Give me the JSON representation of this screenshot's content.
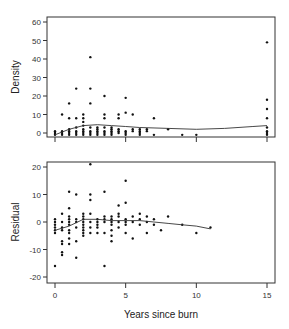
{
  "chart_data": [
    {
      "type": "scatter",
      "panel": "top",
      "title": "",
      "xlabel": "",
      "ylabel": "Density",
      "xlim": [
        -0.5,
        15.5
      ],
      "ylim": [
        -2,
        62
      ],
      "yticks": [
        0,
        10,
        20,
        30,
        40,
        50,
        60
      ],
      "xticks": [
        0,
        5,
        10,
        15
      ],
      "grid": false,
      "points": [
        [
          0,
          0
        ],
        [
          0,
          1
        ],
        [
          0,
          -1
        ],
        [
          0.5,
          0
        ],
        [
          0.5,
          1
        ],
        [
          0.5,
          -1
        ],
        [
          0.5,
          10
        ],
        [
          1,
          0
        ],
        [
          1,
          1
        ],
        [
          1,
          2
        ],
        [
          1,
          -1
        ],
        [
          1,
          8
        ],
        [
          1,
          16
        ],
        [
          1.5,
          0
        ],
        [
          1.5,
          1
        ],
        [
          1.5,
          3
        ],
        [
          1.5,
          8
        ],
        [
          1.5,
          24
        ],
        [
          1.5,
          -1
        ],
        [
          2,
          0
        ],
        [
          2,
          1
        ],
        [
          2,
          2
        ],
        [
          2,
          4
        ],
        [
          2,
          6
        ],
        [
          2,
          8
        ],
        [
          2,
          10
        ],
        [
          2,
          -1
        ],
        [
          2.5,
          0
        ],
        [
          2.5,
          1
        ],
        [
          2.5,
          3
        ],
        [
          2.5,
          -1
        ],
        [
          2.5,
          16
        ],
        [
          2.5,
          24
        ],
        [
          2.5,
          41
        ],
        [
          3,
          0
        ],
        [
          3,
          1
        ],
        [
          3,
          2
        ],
        [
          3,
          3
        ],
        [
          3,
          -1
        ],
        [
          3.5,
          0
        ],
        [
          3.5,
          1
        ],
        [
          3.5,
          3
        ],
        [
          3.5,
          8
        ],
        [
          3.5,
          10
        ],
        [
          3.5,
          20
        ],
        [
          3.5,
          -1
        ],
        [
          4,
          0
        ],
        [
          4,
          1
        ],
        [
          4,
          2
        ],
        [
          4,
          3
        ],
        [
          4,
          -1
        ],
        [
          4.5,
          0
        ],
        [
          4.5,
          1
        ],
        [
          4.5,
          2
        ],
        [
          4.5,
          8
        ],
        [
          4.5,
          10
        ],
        [
          5,
          0
        ],
        [
          5,
          1
        ],
        [
          5,
          -1
        ],
        [
          5,
          11
        ],
        [
          5,
          19
        ],
        [
          5.5,
          1
        ],
        [
          5.5,
          2
        ],
        [
          5.5,
          10
        ],
        [
          6,
          0
        ],
        [
          6,
          1
        ],
        [
          6,
          2
        ],
        [
          6,
          -1
        ],
        [
          6.5,
          1
        ],
        [
          6.5,
          2
        ],
        [
          7,
          -1
        ],
        [
          7,
          8
        ],
        [
          8,
          2
        ],
        [
          9,
          -1
        ],
        [
          10,
          -1
        ],
        [
          15,
          -1
        ],
        [
          15,
          0
        ],
        [
          15,
          1
        ],
        [
          15,
          3
        ],
        [
          15,
          8
        ],
        [
          15,
          13
        ],
        [
          15,
          18
        ],
        [
          15,
          49
        ]
      ],
      "smooth_line": {
        "x": [
          0,
          1,
          2,
          3,
          4,
          5,
          6,
          8,
          10,
          12,
          14,
          15
        ],
        "y": [
          -1,
          2,
          4,
          4.5,
          4,
          3.5,
          3,
          2.5,
          2,
          2.5,
          3.5,
          4
        ]
      }
    },
    {
      "type": "scatter",
      "panel": "bottom",
      "title": "",
      "xlabel": "Years since burn",
      "ylabel": "Residual",
      "xlim": [
        -0.5,
        15.5
      ],
      "ylim": [
        -22,
        22
      ],
      "yticks": [
        -20,
        -10,
        0,
        10,
        20
      ],
      "xticks": [
        0,
        5,
        10,
        15
      ],
      "grid": false,
      "points": [
        [
          0,
          1
        ],
        [
          0,
          0
        ],
        [
          0,
          -1
        ],
        [
          0,
          -2
        ],
        [
          0,
          -3
        ],
        [
          0,
          -4
        ],
        [
          0,
          -16
        ],
        [
          0.5,
          3
        ],
        [
          0.5,
          0
        ],
        [
          0.5,
          -2
        ],
        [
          0.5,
          -3
        ],
        [
          0.5,
          -7
        ],
        [
          0.5,
          -8
        ],
        [
          0.5,
          -12
        ],
        [
          0.5,
          -11
        ],
        [
          1,
          11
        ],
        [
          1,
          5
        ],
        [
          1,
          2
        ],
        [
          1,
          1
        ],
        [
          1,
          0
        ],
        [
          1,
          -1
        ],
        [
          1,
          -3
        ],
        [
          1,
          -4
        ],
        [
          1,
          -6
        ],
        [
          1,
          -8
        ],
        [
          1.5,
          10
        ],
        [
          1.5,
          1
        ],
        [
          1.5,
          0
        ],
        [
          1.5,
          -2
        ],
        [
          1.5,
          -7
        ],
        [
          1.5,
          -13
        ],
        [
          2,
          3
        ],
        [
          2,
          2
        ],
        [
          2,
          1
        ],
        [
          2,
          0
        ],
        [
          2,
          -1
        ],
        [
          2,
          -2
        ],
        [
          2,
          -3
        ],
        [
          2,
          -4
        ],
        [
          2,
          -5
        ],
        [
          2.5,
          21
        ],
        [
          2.5,
          10
        ],
        [
          2.5,
          8
        ],
        [
          2.5,
          3
        ],
        [
          2.5,
          0
        ],
        [
          2.5,
          -2
        ],
        [
          2.5,
          -4
        ],
        [
          3,
          1
        ],
        [
          3,
          0
        ],
        [
          3,
          -1
        ],
        [
          3,
          -2
        ],
        [
          3,
          -4
        ],
        [
          3.5,
          11
        ],
        [
          3.5,
          2
        ],
        [
          3.5,
          1
        ],
        [
          3.5,
          0
        ],
        [
          3.5,
          -4
        ],
        [
          3.5,
          -16
        ],
        [
          4,
          2
        ],
        [
          4,
          1
        ],
        [
          4,
          0
        ],
        [
          4,
          -1
        ],
        [
          4,
          -3
        ],
        [
          4,
          -5
        ],
        [
          4,
          -7
        ],
        [
          4.5,
          6
        ],
        [
          4.5,
          3
        ],
        [
          4.5,
          2
        ],
        [
          4.5,
          0
        ],
        [
          4.5,
          -2
        ],
        [
          5,
          15
        ],
        [
          5,
          7
        ],
        [
          5,
          1
        ],
        [
          5,
          0
        ],
        [
          5,
          -1
        ],
        [
          5,
          -4
        ],
        [
          5.5,
          2
        ],
        [
          5.5,
          0
        ],
        [
          5.5,
          -6
        ],
        [
          6,
          3
        ],
        [
          6,
          1
        ],
        [
          6,
          -1
        ],
        [
          6.5,
          2
        ],
        [
          6.5,
          0
        ],
        [
          6.5,
          -4
        ],
        [
          7,
          -1
        ],
        [
          7,
          1
        ],
        [
          7.5,
          -3
        ],
        [
          8,
          2
        ],
        [
          9,
          -1
        ],
        [
          10,
          -4
        ],
        [
          11,
          -2
        ]
      ],
      "smooth_line": {
        "x": [
          0,
          1,
          2,
          3,
          4,
          5,
          6,
          7,
          8,
          9,
          10,
          11
        ],
        "y": [
          -3,
          -1.5,
          1,
          1,
          0.5,
          0.5,
          0.5,
          0,
          -0.5,
          -1,
          -1.5,
          -2.5
        ]
      }
    }
  ],
  "panels": {
    "top": {
      "ylabel": "Density",
      "yticks": [
        "0",
        "10",
        "20",
        "30",
        "40",
        "50",
        "60"
      ]
    },
    "bottom": {
      "ylabel": "Residual",
      "yticks": [
        "-20",
        "-10",
        "0",
        "10",
        "20"
      ],
      "xticks": [
        "0",
        "5",
        "10",
        "15"
      ],
      "xlabel": "Years since burn"
    }
  }
}
